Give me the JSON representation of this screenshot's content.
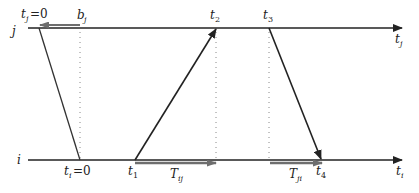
{
  "diagram": {
    "type": "clock-synchronization-timeline",
    "colors": {
      "line": "#222222",
      "gray_arrow": "#7a7a7a",
      "dotted": "#888888",
      "background": "#ffffff"
    },
    "processes": {
      "j": {
        "label": "j",
        "axis_label": "t",
        "axis_sub": "j"
      },
      "i": {
        "label": "i",
        "axis_label": "t",
        "axis_sub": "i"
      }
    },
    "labels": {
      "tj0": {
        "main": "t",
        "sub": "j",
        "suffix": "=0"
      },
      "bj": {
        "main": "b",
        "sub": "j"
      },
      "t2": {
        "main": "t",
        "sub": "2"
      },
      "t3": {
        "main": "t",
        "sub": "3"
      },
      "ti0": {
        "main": "t",
        "sub": "i",
        "suffix": "=0"
      },
      "t1": {
        "main": "t",
        "sub": "1"
      },
      "Tij": {
        "main": "T",
        "sub": "ij"
      },
      "Tji": {
        "main": "T",
        "sub": "ji"
      },
      "t4": {
        "main": "t",
        "sub": "4"
      }
    },
    "messages": [
      {
        "from": "j",
        "at": "tj0",
        "to": "i",
        "at_to": "ti0",
        "arrow": false
      },
      {
        "from": "i",
        "at": "t1",
        "to": "j",
        "at_to": "t2",
        "arrow": true
      },
      {
        "from": "j",
        "at": "t3",
        "to": "i",
        "at_to": "t4",
        "arrow": true
      }
    ],
    "intervals": [
      {
        "name": "bj",
        "on": "j",
        "from": "bj",
        "to": "tj0",
        "direction": "left"
      },
      {
        "name": "Tij",
        "on": "i",
        "from": "t1",
        "to": "t2",
        "direction": "right"
      },
      {
        "name": "Tji",
        "on": "i",
        "from": "t3",
        "to": "t4",
        "direction": "right"
      }
    ]
  }
}
